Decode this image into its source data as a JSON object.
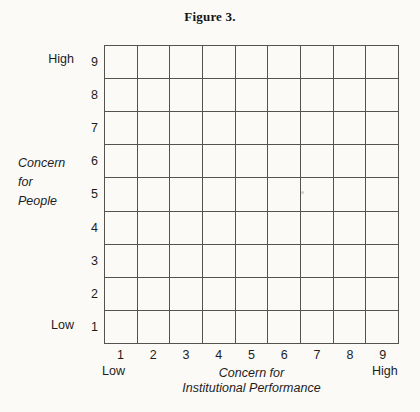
{
  "figure": {
    "title": "Figure 3."
  },
  "chart_data": {
    "type": "grid",
    "title": "Figure 3.",
    "xlabel": "Concern for Institutional Performance",
    "ylabel": "Concern for People",
    "xlabel_lines": [
      "Concern for",
      "Institutional Performance"
    ],
    "ylabel_lines": [
      "Concern",
      "for",
      "People"
    ],
    "x_ticks": [
      "1",
      "2",
      "3",
      "4",
      "5",
      "6",
      "7",
      "8",
      "9"
    ],
    "y_ticks": [
      "9",
      "8",
      "7",
      "6",
      "5",
      "4",
      "3",
      "2",
      "1"
    ],
    "x_low_label": "Low",
    "x_high_label": "High",
    "y_low_label": "Low",
    "y_high_label": "High",
    "xlim": [
      1,
      9
    ],
    "ylim": [
      1,
      9
    ],
    "rows": 9,
    "columns": 9,
    "grid": true,
    "legend": null,
    "series": [],
    "values": [],
    "annotations": [],
    "grid_line_color": "#53534f",
    "background_color": "#fbfaf7",
    "text_color": "#1d1d1d"
  }
}
